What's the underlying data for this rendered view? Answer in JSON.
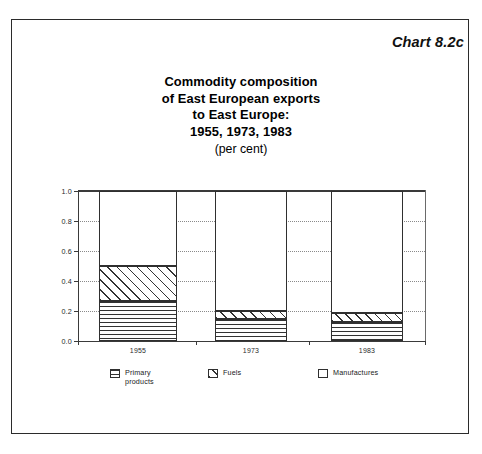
{
  "chart_id_label": "Chart 8.2c",
  "title": {
    "line1": "Commodity composition",
    "line2": "of East European exports",
    "line3": "to East Europe:",
    "line4": "1955, 1973, 1983",
    "units": "(per cent)"
  },
  "legend": {
    "items": [
      {
        "label": "Primary\nproducts",
        "pattern": "horizontal-lines",
        "swatch_name": "legend-swatch-primary-products"
      },
      {
        "label": "Fuels",
        "pattern": "diagonal-lines",
        "swatch_name": "legend-swatch-fuels"
      },
      {
        "label": "Manufactures",
        "pattern": "blank",
        "swatch_name": "legend-swatch-manufactures"
      }
    ]
  },
  "axes": {
    "y_ticks": [
      "1.0",
      "0.8",
      "0.6",
      "0.4",
      "0.2",
      "0.0"
    ],
    "x_ticks": [
      "1955",
      "1973",
      "1983"
    ]
  },
  "chart_data": {
    "type": "bar",
    "title": "Commodity composition of East European exports to East Europe: 1955, 1973, 1983 (per cent)",
    "subtitle": "(per cent)",
    "stacked": true,
    "categories": [
      "1955",
      "1973",
      "1983"
    ],
    "series": [
      {
        "name": "Primary products",
        "values": [
          0.27,
          0.15,
          0.13
        ]
      },
      {
        "name": "Fuels",
        "values": [
          0.23,
          0.05,
          0.06
        ]
      },
      {
        "name": "Manufactures",
        "values": [
          0.5,
          0.8,
          0.81
        ]
      }
    ],
    "cumulative_tops": [
      {
        "category": "1955",
        "primary_top": 0.27,
        "fuels_top": 0.5,
        "manufactures_top": 1.0
      },
      {
        "category": "1973",
        "primary_top": 0.15,
        "fuels_top": 0.2,
        "manufactures_top": 1.0
      },
      {
        "category": "1983",
        "primary_top": 0.13,
        "fuels_top": 0.19,
        "manufactures_top": 1.0
      }
    ],
    "xlabel": "",
    "ylabel": "",
    "ylim": [
      0.0,
      1.0
    ],
    "ytick_values": [
      0.0,
      0.2,
      0.4,
      0.6,
      0.8,
      1.0
    ],
    "grid": "horizontal-dotted",
    "legend_position": "bottom"
  },
  "colors": {
    "ink": "#000000",
    "frame": "#2b2b2b",
    "axis": "#3a3a3a",
    "grid": "#8a8a8a",
    "background": "#ffffff"
  }
}
